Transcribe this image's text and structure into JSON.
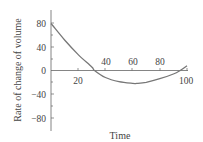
{
  "chart_data": {
    "type": "line",
    "title": "",
    "xlabel": "Time",
    "ylabel": "Rate of change of volume",
    "xlim": [
      0,
      100
    ],
    "ylim": [
      -100,
      100
    ],
    "x_ticks": [
      20,
      40,
      60,
      80,
      100
    ],
    "y_ticks": [
      80,
      40,
      0,
      -40,
      -80
    ],
    "grid": false,
    "series": [
      {
        "name": "rate",
        "x": [
          0,
          10,
          20,
          30,
          32,
          40,
          50,
          60,
          63,
          70,
          80,
          90,
          95,
          100
        ],
        "values": [
          80,
          52,
          27,
          6,
          0,
          -12,
          -19,
          -22,
          -22,
          -20,
          -14,
          -6,
          0,
          8
        ]
      }
    ]
  },
  "labels": {
    "xlabel": "Time",
    "ylabel": "Rate of change of volume",
    "x_ticks": [
      "20",
      "40",
      "60",
      "80",
      "100"
    ],
    "y_ticks": [
      "80",
      "40",
      "0",
      "−40",
      "−80"
    ]
  }
}
